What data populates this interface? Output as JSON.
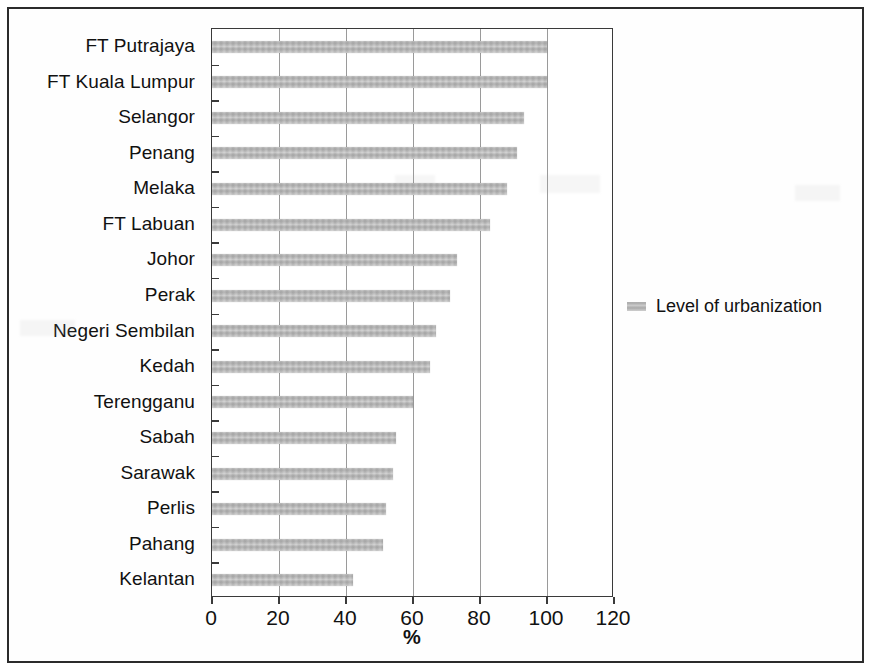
{
  "chart_data": {
    "type": "bar",
    "orientation": "horizontal",
    "title": "",
    "xlabel": "%",
    "ylabel": "",
    "xlim": [
      0,
      120
    ],
    "xticks": [
      0,
      20,
      40,
      60,
      80,
      100,
      120
    ],
    "xtick_labels": [
      "0",
      "20",
      "40",
      "60",
      "80",
      "100",
      "120"
    ],
    "grid": "vertical",
    "legend_position": "right",
    "legend": [
      "Level of urbanization"
    ],
    "series_name": "Level of urbanization",
    "bar_color": "#b9b9b9",
    "categories": [
      "FT Putrajaya",
      "FT Kuala Lumpur",
      "Selangor",
      "Penang",
      "Melaka",
      "FT Labuan",
      "Johor",
      "Perak",
      "Negeri Sembilan",
      "Kedah",
      "Terengganu",
      "Sabah",
      "Sarawak",
      "Perlis",
      "Pahang",
      "Kelantan"
    ],
    "values": [
      100,
      100,
      93,
      91,
      88,
      83,
      73,
      71,
      67,
      65,
      60,
      55,
      54,
      52,
      51,
      42
    ],
    "series": [
      {
        "name": "Level of urbanization",
        "values": [
          100,
          100,
          93,
          91,
          88,
          83,
          73,
          71,
          67,
          65,
          60,
          55,
          54,
          52,
          51,
          42
        ]
      }
    ]
  },
  "axis": {
    "x_title": "%",
    "tick_labels": [
      "0",
      "20",
      "40",
      "60",
      "80",
      "100",
      "120"
    ]
  },
  "legend": {
    "label": "Level of urbanization"
  }
}
